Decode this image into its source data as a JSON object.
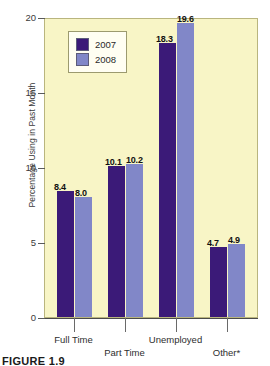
{
  "chart_data": {
    "type": "bar",
    "title": "",
    "xlabel": "",
    "ylabel": "Percentage Using in Past Month",
    "ylim": [
      0,
      20
    ],
    "yticks": [
      0,
      5,
      10,
      15,
      20
    ],
    "ytick_labels": [
      "0",
      "5",
      "10",
      "15",
      "20"
    ],
    "grid": false,
    "legend_position": "top-left-inside",
    "categories": [
      "Full Time",
      "Part Time",
      "Unemployed",
      "Other*"
    ],
    "series": [
      {
        "name": "2007",
        "color": "#3b1a78",
        "values": [
          8.4,
          10.1,
          18.3,
          4.7
        ]
      },
      {
        "name": "2008",
        "color": "#8187c8",
        "values": [
          8.0,
          10.2,
          19.6,
          4.9
        ]
      }
    ],
    "data_labels": [
      [
        "8.4",
        "10.1",
        "18.3",
        "4.7"
      ],
      [
        "8.0",
        "10.2",
        "19.6",
        "4.9"
      ]
    ],
    "plot_background_color": "#f8f5c6",
    "annotations": []
  },
  "legend": {
    "items": [
      {
        "label": "2007",
        "color": "#3b1a78"
      },
      {
        "label": "2008",
        "color": "#8187c8"
      }
    ]
  },
  "caption": {
    "text": "FIGURE 1.9"
  }
}
